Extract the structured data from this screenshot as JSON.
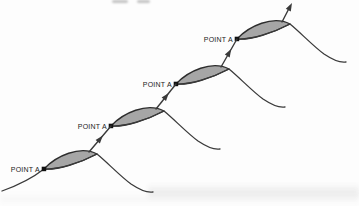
{
  "figure": {
    "type": "overlapping-waves-diagram",
    "background": "#fdfdfd",
    "wave_color": "#3a3a3a",
    "lens_fill": "#a6a6a6",
    "lens_stroke": "#2d2d2d",
    "marker_color": "#111111",
    "label_color": "#1c1c1c",
    "points": [
      {
        "label": "POINT A"
      },
      {
        "label": "POINT A"
      },
      {
        "label": "POINT A"
      },
      {
        "label": "POINT A"
      }
    ]
  }
}
